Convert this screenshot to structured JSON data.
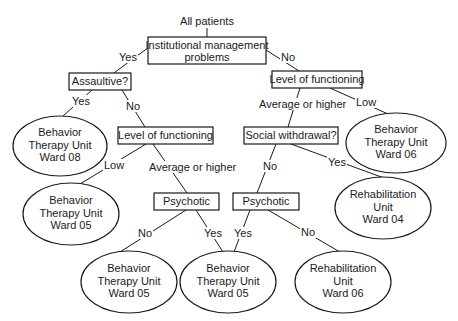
{
  "diagram": {
    "type": "decision-tree",
    "root_label": "All patients",
    "nodes": {
      "root": {
        "lines": [
          "Institutional management",
          "problems"
        ]
      },
      "assaultive": {
        "lines": [
          "Assaultive?"
        ]
      },
      "lof_left": {
        "lines": [
          "Level of functioning"
        ]
      },
      "lof_right": {
        "lines": [
          "Level of functioning"
        ]
      },
      "social": {
        "lines": [
          "Social withdrawal?"
        ]
      },
      "psych_left": {
        "lines": [
          "Psychotic"
        ]
      },
      "psych_right": {
        "lines": [
          "Psychotic"
        ]
      },
      "bt08": {
        "lines": [
          "Behavior",
          "Therapy Unit",
          "Ward 08"
        ]
      },
      "bt06": {
        "lines": [
          "Behavior",
          "Therapy Unit",
          "Ward 06"
        ]
      },
      "bt05_mid": {
        "lines": [
          "Behavior",
          "Therapy Unit",
          "Ward 05"
        ]
      },
      "rh04": {
        "lines": [
          "Rehabilitation",
          "Unit",
          "Ward 04"
        ]
      },
      "bt05_bl": {
        "lines": [
          "Behavior",
          "Therapy Unit",
          "Ward 05"
        ]
      },
      "bt05_bc": {
        "lines": [
          "Behavior",
          "Therapy Unit",
          "Ward 05"
        ]
      },
      "rh06": {
        "lines": [
          "Rehabilitation",
          "Unit",
          "Ward 06"
        ]
      }
    },
    "edges": {
      "root_assaultive": "Yes",
      "root_lofright": "No",
      "assaultive_bt08": "Yes",
      "assaultive_lofleft": "No",
      "lofleft_bt05mid": "Low",
      "lofleft_psychleft": "Average or higher",
      "lofright_social": "Average or higher",
      "lofright_bt06": "Low",
      "social_psychright": "No",
      "social_rh04": "Yes",
      "psychleft_bt05bl": "No",
      "psychleft_bt05bc": "Yes",
      "psychright_bt05bc": "Yes",
      "psychright_rh06": "No"
    }
  }
}
